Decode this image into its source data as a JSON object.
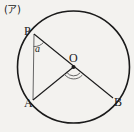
{
  "figure": {
    "section_label": "(ア)",
    "background_color": "#f3f2ef",
    "stroke_color": "#1a1a1a",
    "thin_stroke_color": "#555555",
    "points": {
      "P": {
        "label": "P",
        "x": 34,
        "y": 34
      },
      "O": {
        "label": "O",
        "x": 73.5,
        "y": 67
      },
      "A": {
        "label": "A",
        "x": 33,
        "y": 100
      },
      "B": {
        "label": "B",
        "x": 113,
        "y": 98
      }
    },
    "circle": {
      "cx": 73.5,
      "cy": 67,
      "r": 56
    },
    "angles": {
      "at_p": {
        "label": "a",
        "type": "single-arc"
      },
      "at_o": {
        "label": "",
        "type": "double-arc"
      }
    },
    "segments": [
      {
        "name": "diameter-PB",
        "from": "P",
        "to": "B"
      },
      {
        "name": "radius-OA",
        "from": "O",
        "to": "A"
      },
      {
        "name": "chord-PA",
        "from": "P",
        "to": "A"
      }
    ]
  }
}
